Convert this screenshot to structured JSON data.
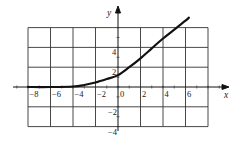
{
  "chart_data": {
    "type": "line",
    "title": "",
    "xlabel": "x",
    "ylabel": "y",
    "xlim": [
      -8,
      7
    ],
    "ylim": [
      -4,
      6
    ],
    "grid": true,
    "grid_spacing": 2,
    "x_tick_labels": [
      "-8",
      "-6",
      "-4",
      "-2",
      "0",
      "2",
      "4",
      "6"
    ],
    "y_tick_labels": [
      "4",
      "2",
      "-2",
      "-4"
    ],
    "series": [
      {
        "name": "f(x)",
        "x": [
          -8,
          -6,
          -4,
          -3,
          -2,
          -1,
          0,
          1,
          2,
          3,
          4,
          5,
          6,
          6.3
        ],
        "y": [
          0,
          0,
          0.05,
          0.2,
          0.45,
          0.8,
          1.2,
          2.0,
          2.9,
          3.9,
          4.9,
          5.8,
          6.7,
          7.0
        ]
      }
    ]
  }
}
